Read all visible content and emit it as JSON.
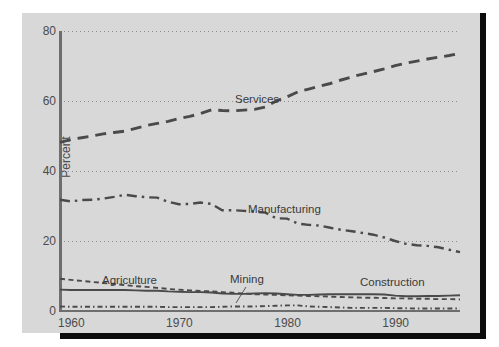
{
  "figure": {
    "top_cut_text": ". .  . .   .  .   . .",
    "background_color": "#d8d8d8",
    "border_color": "#0c0c0c"
  },
  "axes": {
    "ylabel": "Percent",
    "yticks": [
      0,
      20,
      40,
      60,
      80
    ],
    "ylim": [
      0,
      80
    ],
    "xticks": [
      1960,
      1970,
      1980,
      1990
    ],
    "xlim": [
      1960,
      1997
    ],
    "grid": "dotted-horizontal"
  },
  "annotations": {
    "services": "Services",
    "manufacturing": "Manufacturing",
    "agriculture": "Agriculture",
    "mining": "Mining",
    "construction": "Construction"
  },
  "chart_data": {
    "type": "line",
    "title": "",
    "xlabel": "",
    "ylabel": "Percent",
    "xlim": [
      1960,
      1997
    ],
    "ylim": [
      0,
      80
    ],
    "grid": true,
    "legend": "inline-annotations",
    "x": [
      1960,
      1961,
      1962,
      1963,
      1964,
      1965,
      1966,
      1967,
      1968,
      1969,
      1970,
      1971,
      1972,
      1973,
      1974,
      1975,
      1976,
      1977,
      1978,
      1979,
      1980,
      1981,
      1982,
      1983,
      1984,
      1985,
      1986,
      1987,
      1988,
      1989,
      1990,
      1991,
      1992,
      1993,
      1994,
      1995,
      1996,
      1997
    ],
    "series": [
      {
        "name": "Services",
        "line_style": "dashed",
        "color": "#4a4a4a",
        "values": [
          48.2,
          49.0,
          49.5,
          50.0,
          50.6,
          51.0,
          51.4,
          52.2,
          53.0,
          53.6,
          54.2,
          55.0,
          55.6,
          56.4,
          57.5,
          57.3,
          57.2,
          57.4,
          57.6,
          58.3,
          60.0,
          61.2,
          62.6,
          63.4,
          64.2,
          65.0,
          66.0,
          66.9,
          67.7,
          68.4,
          69.2,
          70.1,
          70.8,
          71.4,
          72.0,
          72.5,
          73.0,
          73.6
        ]
      },
      {
        "name": "Manufacturing",
        "line_style": "dash-dot",
        "color": "#4a4a4a",
        "values": [
          31.8,
          31.3,
          31.7,
          31.8,
          32.1,
          32.6,
          33.2,
          32.8,
          32.5,
          32.4,
          31.2,
          30.5,
          30.6,
          31.0,
          30.6,
          28.8,
          28.8,
          28.6,
          28.4,
          28.1,
          26.5,
          26.4,
          25.0,
          24.6,
          24.4,
          23.8,
          23.2,
          22.8,
          22.3,
          21.8,
          21.0,
          20.0,
          19.2,
          18.8,
          18.6,
          18.2,
          17.5,
          16.8
        ]
      },
      {
        "name": "Agriculture",
        "line_style": "dashed-fine",
        "color": "#4a4a4a",
        "values": [
          9.2,
          8.9,
          8.6,
          8.3,
          8.0,
          7.7,
          7.4,
          7.1,
          6.9,
          6.6,
          6.3,
          6.1,
          5.9,
          5.7,
          5.6,
          5.4,
          5.2,
          5.0,
          4.8,
          4.7,
          4.6,
          4.5,
          4.4,
          4.3,
          4.2,
          4.1,
          4.0,
          3.9,
          3.8,
          3.8,
          3.7,
          3.6,
          3.6,
          3.5,
          3.5,
          3.4,
          3.4,
          3.3
        ]
      },
      {
        "name": "Construction",
        "line_style": "solid",
        "color": "#4a4a4a",
        "values": [
          6.1,
          6.0,
          6.0,
          6.0,
          6.0,
          6.0,
          6.0,
          5.9,
          5.8,
          5.8,
          5.6,
          5.5,
          5.4,
          5.4,
          5.3,
          5.0,
          4.9,
          4.9,
          5.0,
          5.1,
          5.0,
          4.8,
          4.6,
          4.6,
          4.7,
          4.8,
          4.8,
          4.8,
          4.8,
          4.8,
          4.7,
          4.4,
          4.2,
          4.2,
          4.3,
          4.3,
          4.4,
          4.5
        ]
      },
      {
        "name": "Mining",
        "line_style": "dash-dot-fine",
        "color": "#4a4a4a",
        "values": [
          1.3,
          1.2,
          1.2,
          1.2,
          1.2,
          1.2,
          1.2,
          1.2,
          1.2,
          1.2,
          1.1,
          1.1,
          1.1,
          1.1,
          1.1,
          1.2,
          1.3,
          1.3,
          1.3,
          1.4,
          1.5,
          1.6,
          1.6,
          1.3,
          1.2,
          1.1,
          1.0,
          0.9,
          0.9,
          0.9,
          0.9,
          0.8,
          0.8,
          0.7,
          0.7,
          0.7,
          0.7,
          0.7
        ]
      }
    ]
  }
}
